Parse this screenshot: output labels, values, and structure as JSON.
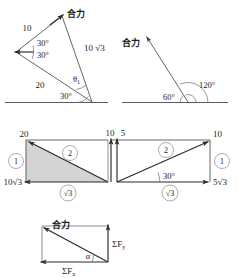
{
  "figure": {
    "title_text": "",
    "colors": {
      "line": "#55555a",
      "dark_line": "#2a2a2e",
      "shade_fill": "#d4d4d4",
      "text": "#1d1d1d"
    }
  },
  "panel_top_left": {
    "name": "triangle-resultant-30-30",
    "resultant_label": "合力",
    "side_upper_label": "10",
    "side_lower_label": "20",
    "side_right_label": "10 √3",
    "angle_upper_label": "30°",
    "angle_lower_label": "30°",
    "angle_base_label": "30°",
    "angle_theta_label": "θ",
    "angle_theta_sub": "1"
  },
  "panel_top_right": {
    "name": "resultant-60-120",
    "resultant_label": "合力",
    "angle_left_label": "60°",
    "angle_right_label": "120°"
  },
  "panel_mid_left": {
    "name": "shaded-right-triangle",
    "vertical_label": "20",
    "horizontal_label": "10√3",
    "ratio_side_label": "√3",
    "circled_1": "1",
    "circled_2": "2"
  },
  "panel_mid_right": {
    "name": "right-triangle-30",
    "left_label_a": "10",
    "left_label_b": "5",
    "top_right_label": "10",
    "bottom_right_label": "5√3",
    "ratio_side_label": "√3",
    "angle_label": "30°",
    "circled_1": "1",
    "circled_2": "2"
  },
  "panel_bottom": {
    "name": "sum-of-forces-triangle",
    "resultant_label": "合力",
    "sum_fy_label": "ΣF",
    "sum_fy_sub": "y",
    "sum_fx_label": "ΣF",
    "sum_fx_sub": "x",
    "angle_label": "α"
  }
}
